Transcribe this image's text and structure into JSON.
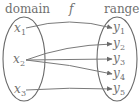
{
  "diagram": {
    "domain_label": "domain",
    "range_label": "range",
    "function_label": "f",
    "domain_elements": [
      {
        "var": "x",
        "sub": "1"
      },
      {
        "var": "x",
        "sub": "2"
      },
      {
        "var": "x",
        "sub": "3"
      }
    ],
    "range_elements": [
      {
        "var": "y",
        "sub": "1"
      },
      {
        "var": "y",
        "sub": "2"
      },
      {
        "var": "y",
        "sub": "3"
      },
      {
        "var": "y",
        "sub": "4"
      },
      {
        "var": "y",
        "sub": "5"
      }
    ],
    "mappings": [
      {
        "from": "x1",
        "to": "y1"
      },
      {
        "from": "x2",
        "to": "y2"
      },
      {
        "from": "x2",
        "to": "y3"
      },
      {
        "from": "x2",
        "to": "y4"
      },
      {
        "from": "x3",
        "to": "y5"
      }
    ],
    "colors": {
      "stroke": "#7a7a7a",
      "text": "#707070"
    }
  }
}
